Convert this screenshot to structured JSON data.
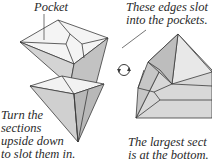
{
  "captions": {
    "pocket": "Pocket",
    "edges_slot": [
      "These edges slot",
      "into the pockets."
    ],
    "turn_sections": [
      "Turn the",
      "sections",
      "upside down",
      "to slot them in."
    ],
    "largest_section": [
      "The largest sect",
      "is at the bottom."
    ]
  },
  "icons": {
    "rotate": "rotate-arrows-icon"
  },
  "colors": {
    "line": "#3a3a3a",
    "face_light": "#ececec",
    "face_mid": "#cfcfcf",
    "face_dark": "#a9a9a9",
    "text": "#2a2a2a"
  }
}
